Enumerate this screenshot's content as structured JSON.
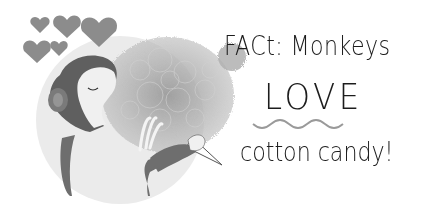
{
  "illustration": {
    "subject": "monkey-eating-cotton-candy",
    "colors": {
      "background": "#ffffff",
      "circle": "#ebebeb",
      "hearts": "#8c8c8c",
      "monkey_fur": "#6e6e6e",
      "monkey_face": "#f0f0f0",
      "cotton_candy": "#a8a8a8",
      "text": "#1c1c1c",
      "underline": "#9a9a9a"
    }
  },
  "caption": {
    "line1": "FACt: Monkeys",
    "line2": "LOVE",
    "line3": "cotton candy!"
  }
}
